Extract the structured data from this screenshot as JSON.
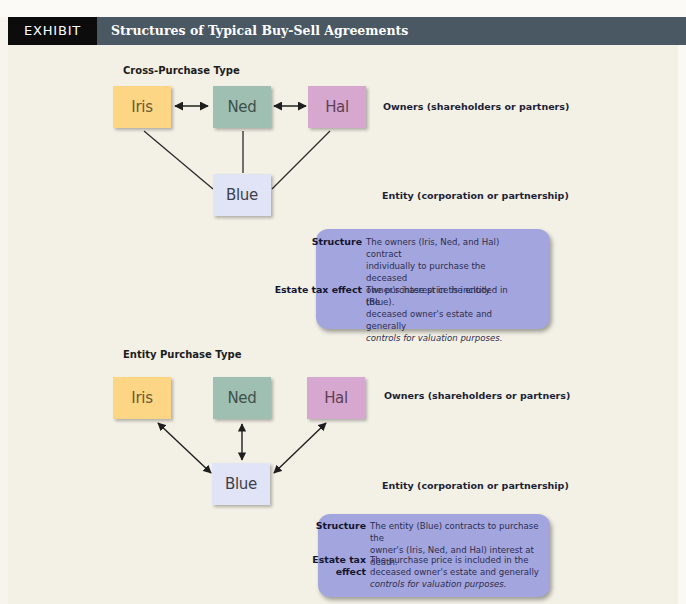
{
  "header": {
    "exhibit_label": "EXHIBIT 19.1",
    "title": "Structures of Typical Buy-Sell Agreements"
  },
  "colors": {
    "header_bar": "#4a5863",
    "exhibit_tag": "#0c0c0c",
    "background": "#f3f1e6",
    "iris": "#fcd585",
    "ned": "#9ebfb2",
    "hal": "#d6a8cf",
    "blue": "#e1e4f6",
    "infobox": "#a3a6de"
  },
  "cross_purchase": {
    "section_title": "Cross-Purchase Type",
    "nodes": {
      "iris": "Iris",
      "ned": "Ned",
      "hal": "Hal",
      "entity": "Blue"
    },
    "owners_label": "Owners (shareholders or partners)",
    "entity_label": "Entity (corporation or partnership)",
    "structure_key": "Structure",
    "structure_text": "The owners (Iris, Ned, and Hal) contract individually to purchase the deceased owner's interest in the entity (Blue).",
    "structure_lines": [
      "The owners (Iris, Ned, and Hal) contract",
      "individually to purchase the deceased",
      "owner's interest in the entity (Blue)."
    ],
    "tax_key": "Estate tax effect",
    "tax_lines": [
      "The purchase price is included in the",
      "deceased owner's estate and generally"
    ],
    "tax_italic": "controls for valuation purposes."
  },
  "entity_purchase": {
    "section_title": "Entity Purchase Type",
    "nodes": {
      "iris": "Iris",
      "ned": "Ned",
      "hal": "Hal",
      "entity": "Blue"
    },
    "owners_label": "Owners (shareholders or partners)",
    "entity_label": "Entity (corporation or partnership)",
    "structure_key": "Structure",
    "structure_lines": [
      "The entity (Blue) contracts to purchase the",
      "owner's (Iris, Ned, and Hal) interest at death."
    ],
    "tax_key": "Estate tax effect",
    "tax_lines": [
      "The purchase price is included in the",
      "deceased owner's estate and generally"
    ],
    "tax_italic": "controls for valuation purposes."
  }
}
